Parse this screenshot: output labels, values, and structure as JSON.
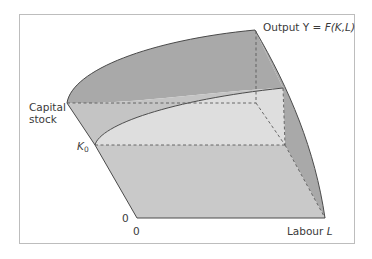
{
  "diagram": {
    "type": "3d-production-surface",
    "labels": {
      "output_prefix": "Output Y = ",
      "output_function": "F(K,L)",
      "capital_line1": "Capital",
      "capital_line2": "stock",
      "k0_symbol": "K",
      "k0_sub": "0",
      "origin_k": "0",
      "origin_l": "0",
      "labour_prefix": "Labour ",
      "labour_symbol": "L"
    },
    "colors": {
      "dark_shade": "#a9a9a9",
      "mid_shade": "#c4c4c4",
      "light_shade": "#dedede",
      "outline": "#4a4a4a",
      "dash": "#5a5a5a",
      "frame": "#bdbdbd"
    }
  }
}
